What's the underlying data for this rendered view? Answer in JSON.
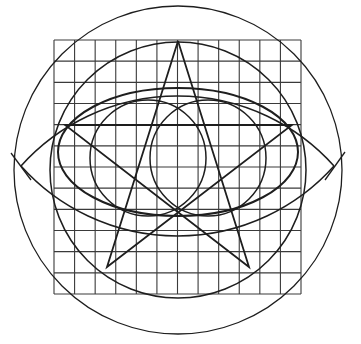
{
  "diagram": {
    "title": "",
    "background": "#ffffff",
    "stroke_color": "#1e1e1e",
    "grid_color": "#3a3a3a",
    "grid": {
      "x0": 54,
      "y0": 40,
      "x1": 301,
      "y1": 294,
      "cols": 12,
      "rows": 12
    },
    "outer_circle": {
      "cx": 178,
      "cy": 170,
      "r": 164
    },
    "inner_large_circle": {
      "cx": 178,
      "cy": 170,
      "r": 128
    },
    "ellipse": {
      "cx": 178,
      "cy": 152,
      "rx": 120,
      "ry": 64
    },
    "small_circles": [
      {
        "cx": 148,
        "cy": 158,
        "r": 58
      },
      {
        "cx": 208,
        "cy": 158,
        "r": 58
      }
    ],
    "vesica_arcs": {
      "upper": {
        "x1": 21,
        "y1": 166,
        "x2": 334,
        "y2": 166,
        "r": 210
      },
      "lower": {
        "x1": 21,
        "y1": 166,
        "x2": 334,
        "y2": 166,
        "r": 210
      }
    },
    "star_points": [
      {
        "x": 178,
        "y": 41
      },
      {
        "x": 249,
        "y": 267
      },
      {
        "x": 65,
        "y": 125
      },
      {
        "x": 292,
        "y": 125
      },
      {
        "x": 107,
        "y": 267
      }
    ],
    "horizontal_chord": {
      "x1": 65,
      "y1": 125,
      "x2": 292,
      "y2": 125
    },
    "tick_marks": [
      {
        "x1": 11,
        "y1": 153,
        "x2": 31,
        "y2": 180
      },
      {
        "x1": 345,
        "y1": 152,
        "x2": 325,
        "y2": 180
      }
    ]
  }
}
